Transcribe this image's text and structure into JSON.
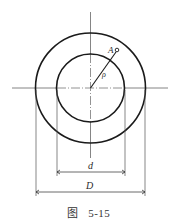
{
  "figure": {
    "caption_prefix": "图",
    "caption_number": "5-15"
  },
  "labels": {
    "point": "A",
    "radius": "ρ",
    "inner_diameter": "d",
    "outer_diameter": "D"
  },
  "geometry": {
    "center": [
      90.5,
      88
    ],
    "outer_radius": 55,
    "inner_radius": 34,
    "point_A": [
      117,
      50
    ],
    "d_dim_y": 172,
    "D_dim_y": 192
  },
  "colors": {
    "stroke": "#1a1a1a",
    "thin_line": "#555555",
    "background": "#ffffff"
  }
}
